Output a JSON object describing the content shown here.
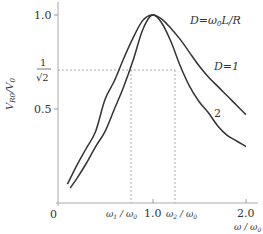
{
  "chart_data": {
    "type": "line",
    "title": "",
    "xlabel": "ω / ω0",
    "ylabel": "V_R0 / V_0",
    "xlim": [
      0,
      2.1
    ],
    "ylim": [
      0,
      1.05
    ],
    "grid": false,
    "x_ticks": [
      {
        "value": 0,
        "label": "0"
      },
      {
        "value": 0.77,
        "label": "ω1 / ω0"
      },
      {
        "value": 1.0,
        "label": "1.0"
      },
      {
        "value": 1.28,
        "label": "ω2 / ω0"
      },
      {
        "value": 2.0,
        "label": "2.0"
      }
    ],
    "y_ticks": [
      {
        "value": 0.5,
        "label": "0.5"
      },
      {
        "value": 0.707,
        "label": "1/√2"
      },
      {
        "value": 1.0,
        "label": "1.0"
      }
    ],
    "annotations": [
      {
        "text": "D=ω0 L/R",
        "x": 1.5,
        "y": 0.96
      },
      {
        "text": "D=1",
        "x": 1.75,
        "y": 0.77
      },
      {
        "text": "2",
        "x": 1.66,
        "y": 0.52
      }
    ],
    "reference_lines": [
      {
        "type": "horizontal",
        "y": 0.707,
        "x_to": 1.28,
        "style": "dashed"
      },
      {
        "type": "vertical",
        "x": 0.77,
        "y_to": 0.707,
        "style": "dashed"
      },
      {
        "type": "vertical",
        "x": 1.28,
        "y_to": 0.707,
        "style": "dashed"
      }
    ],
    "series": [
      {
        "name": "D=1",
        "x": [
          0.1,
          0.2,
          0.3,
          0.4,
          0.5,
          0.6,
          0.7,
          0.8,
          0.9,
          1.0,
          1.1,
          1.2,
          1.3,
          1.4,
          1.5,
          1.6,
          1.7,
          1.8,
          1.9,
          2.0
        ],
        "values": [
          0.1,
          0.2,
          0.29,
          0.38,
          0.55,
          0.65,
          0.77,
          0.88,
          0.97,
          1.0,
          0.98,
          0.93,
          0.87,
          0.8,
          0.73,
          0.67,
          0.62,
          0.57,
          0.52,
          0.47
        ]
      },
      {
        "name": "D=2",
        "x": [
          0.13,
          0.2,
          0.3,
          0.4,
          0.5,
          0.6,
          0.7,
          0.8,
          0.9,
          1.0,
          1.1,
          1.2,
          1.3,
          1.4,
          1.5,
          1.6,
          1.7,
          1.8,
          1.9,
          2.0
        ],
        "values": [
          0.08,
          0.13,
          0.21,
          0.3,
          0.38,
          0.5,
          0.62,
          0.76,
          0.92,
          1.0,
          0.96,
          0.86,
          0.73,
          0.62,
          0.54,
          0.48,
          0.41,
          0.36,
          0.33,
          0.3
        ]
      }
    ]
  },
  "labels": {
    "y_axis_title": "V_R0/V_0",
    "x_axis_title": "ω / ω0",
    "legend_formula": "D=ω0L/R",
    "curve1": "D=1",
    "curve2": "2"
  }
}
